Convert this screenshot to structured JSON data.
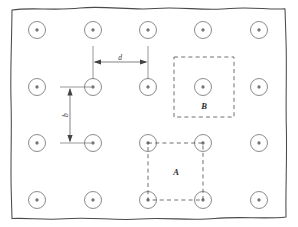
{
  "figure": {
    "name": "well-field-spacing-diagram",
    "canvas": {
      "width": 298,
      "height": 227
    },
    "background_color": "#ffffff",
    "ink_color": "#4a4a4a"
  },
  "boundary": {
    "name": "site-boundary",
    "style": "hand-drawn-wavy-rectangle",
    "left": 11,
    "top": 8,
    "right": 286,
    "bottom": 218,
    "stroke_color": "#4a4a4a"
  },
  "well_grid": {
    "columns_x": [
      37,
      93,
      148,
      203,
      259
    ],
    "rows_y": [
      30,
      87,
      143,
      200
    ],
    "outer_radius": 8.5,
    "inner_radius": 1.4,
    "outer_stroke": "#777777",
    "inner_fill": "#777777",
    "count": 20
  },
  "dimensions": [
    {
      "id": "horizontal-spacing",
      "label": "d",
      "orientation": "horizontal",
      "from_x": 93,
      "to_x": 148,
      "line_y": 62,
      "ext_top_y": 46,
      "ext_bottom_y": 80,
      "label_x": 120,
      "label_y": 59
    },
    {
      "id": "vertical-spacing",
      "label": "b",
      "orientation": "vertical",
      "from_y": 87,
      "to_y": 143,
      "line_x": 70,
      "ext_left_x": 60,
      "ext_right_x": 93,
      "label_x": 66,
      "label_y": 115
    }
  ],
  "regions": [
    {
      "id": "region-b",
      "label": "B",
      "style": "dashed-square",
      "x": 174,
      "y": 57,
      "width": 60,
      "height": 60,
      "label_x": 204,
      "label_y": 107,
      "centered_on_well": true,
      "center_x": 203,
      "center_y": 87
    },
    {
      "id": "region-a",
      "label": "A",
      "style": "dashed-square",
      "x": 148,
      "y": 143,
      "width": 55,
      "height": 57,
      "label_x": 176,
      "label_y": 173,
      "centered_on_well": false,
      "corner_wells": [
        [
          148,
          143
        ],
        [
          203,
          143
        ],
        [
          203,
          200
        ],
        [
          148,
          200
        ]
      ]
    }
  ]
}
